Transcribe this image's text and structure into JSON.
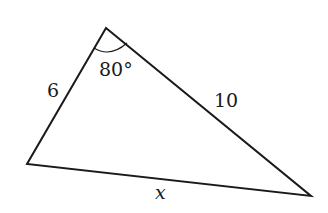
{
  "diagram": {
    "type": "triangle",
    "vertices": {
      "top": [
        106,
        28
      ],
      "left": [
        27,
        164
      ],
      "right": [
        311,
        196
      ]
    },
    "stroke_color": "#1a1a1a",
    "labels": {
      "side_left": "6",
      "side_right": "10",
      "side_bottom": "x",
      "angle_top": "80°"
    }
  }
}
